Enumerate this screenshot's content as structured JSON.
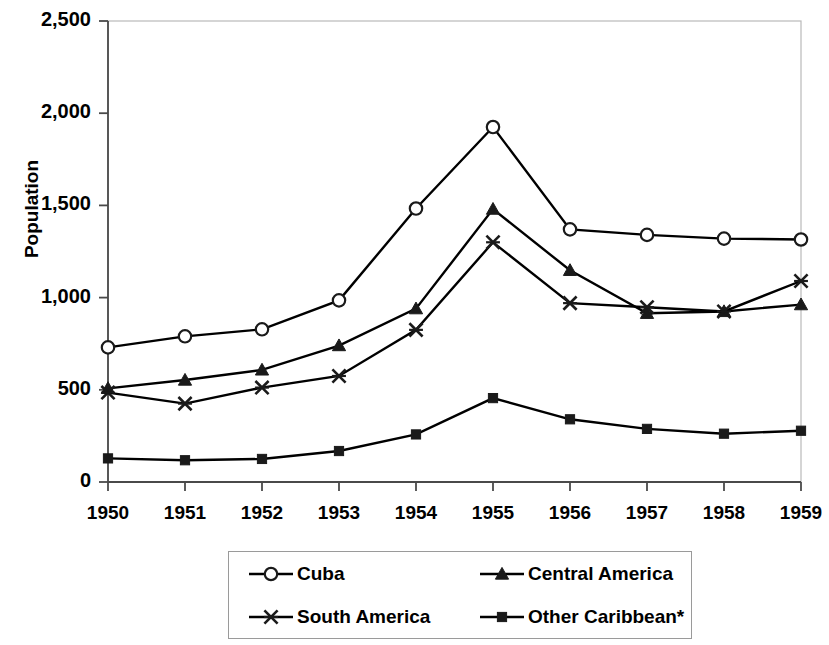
{
  "chart_data": {
    "type": "line",
    "title": "",
    "xlabel": "",
    "ylabel": "Population",
    "x": [
      1950,
      1951,
      1952,
      1953,
      1954,
      1955,
      1956,
      1957,
      1958,
      1959
    ],
    "categories": [
      "1950",
      "1951",
      "1952",
      "1953",
      "1954",
      "1955",
      "1956",
      "1957",
      "1958",
      "1959"
    ],
    "xlim": [
      1950,
      1959
    ],
    "ylim": [
      0,
      2500
    ],
    "ytick_labels": [
      "0",
      "500",
      "1,000",
      "1,500",
      "2,000",
      "2,500"
    ],
    "ytick_values": [
      0,
      500,
      1000,
      1500,
      2000,
      2500
    ],
    "grid": false,
    "legend_position": "bottom",
    "series": [
      {
        "name": "Cuba",
        "marker": "open-circle",
        "color": "#000000",
        "values": [
          730,
          790,
          828,
          985,
          1483,
          1925,
          1370,
          1340,
          1320,
          1315
        ]
      },
      {
        "name": "Central America",
        "marker": "filled-triangle",
        "color": "#000000",
        "values": [
          508,
          553,
          608,
          740,
          940,
          1480,
          1148,
          915,
          925,
          962
        ]
      },
      {
        "name": "South America",
        "marker": "asterisk-x",
        "color": "#000000",
        "values": [
          485,
          425,
          512,
          575,
          825,
          1300,
          970,
          948,
          925,
          1090
        ]
      },
      {
        "name": "Other Caribbean*",
        "marker": "filled-square",
        "color": "#000000",
        "values": [
          128,
          118,
          125,
          168,
          258,
          455,
          340,
          288,
          262,
          278
        ]
      }
    ]
  },
  "legend": {
    "items": [
      {
        "label": "Cuba",
        "marker": "open-circle"
      },
      {
        "label": "Central America",
        "marker": "filled-triangle"
      },
      {
        "label": "South America",
        "marker": "asterisk-x"
      },
      {
        "label": "Other Caribbean*",
        "marker": "filled-square"
      }
    ]
  }
}
